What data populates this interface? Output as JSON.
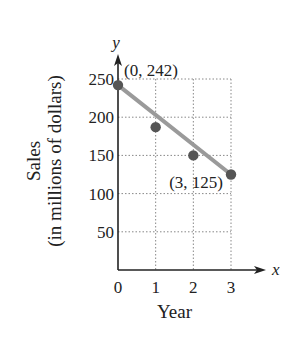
{
  "chart_data": {
    "type": "scatter",
    "title": "",
    "xlabel": "Year",
    "ylabel": "Sales",
    "ylabel_sub": "(in millions of dollars)",
    "x_axis_var": "x",
    "y_axis_var": "y",
    "x": [
      0,
      1,
      2,
      3
    ],
    "series": [
      {
        "name": "Sales data",
        "type": "scatter",
        "values": [
          242,
          187,
          150,
          125
        ],
        "color": "#555555"
      },
      {
        "name": "Linear model",
        "type": "line",
        "x": [
          0,
          3
        ],
        "values": [
          242,
          125
        ],
        "color": "#9a9a9a"
      }
    ],
    "annotations": [
      {
        "text": "(0, 242)",
        "x": 0,
        "y": 242
      },
      {
        "text": "(3, 125)",
        "x": 3,
        "y": 125
      }
    ],
    "x_ticks": [
      0,
      1,
      2,
      3
    ],
    "x_tick_labels": [
      "0",
      "1",
      "2",
      "3"
    ],
    "y_ticks": [
      50,
      100,
      150,
      200,
      250
    ],
    "y_tick_labels": [
      "50",
      "100",
      "150",
      "200",
      "250"
    ],
    "xlim": [
      0,
      3
    ],
    "ylim": [
      0,
      250
    ],
    "grid": true,
    "grid_style": "dotted",
    "legend": "none"
  }
}
